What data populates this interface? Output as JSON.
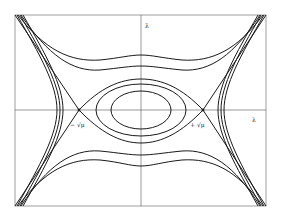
{
  "figure": {
    "type": "phase-portrait",
    "axes": {
      "x_label": "λ",
      "y_label": "λ̇"
    },
    "fixed_points": [
      {
        "kind": "saddle",
        "label": "− √μ",
        "x": -1
      },
      {
        "kind": "center",
        "label": "",
        "x": 0
      },
      {
        "kind": "saddle",
        "label": "+ √μ",
        "x": 1
      }
    ],
    "colors": {
      "curve": "#1a1a1a",
      "axis": "#555555",
      "frame": "#888888",
      "background": "#ffffff"
    }
  }
}
